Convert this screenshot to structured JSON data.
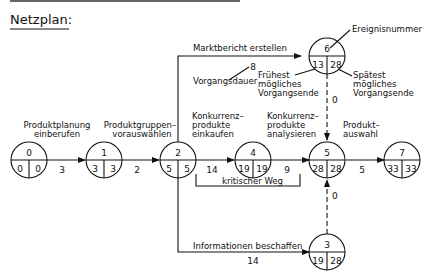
{
  "title": "Netzplan:",
  "nodes": [
    {
      "id": "0",
      "earliest": "0",
      "latest": "0"
    },
    {
      "id": "1",
      "earliest": "3",
      "latest": "3"
    },
    {
      "id": "2",
      "earliest": "5",
      "latest": "5"
    },
    {
      "id": "4",
      "earliest": "19",
      "latest": "19"
    },
    {
      "id": "5",
      "earliest": "28",
      "latest": "28"
    },
    {
      "id": "7",
      "earliest": "33",
      "latest": "33"
    },
    {
      "id": "6",
      "earliest": "13",
      "latest": "28"
    },
    {
      "id": "3",
      "earliest": "19",
      "latest": "28"
    }
  ],
  "activities": {
    "a01": {
      "label1": "Produktplanung",
      "label2": "einberufen",
      "duration": "3"
    },
    "a12": {
      "label1": "Produktgruppen–",
      "label2": "vorauswählen",
      "duration": "2"
    },
    "a24": {
      "label1": "Konkurrenz–",
      "label2": "produkte",
      "label3": "einkaufen",
      "duration": "14"
    },
    "a45": {
      "label1": "Konkurrenz–",
      "label2": "produkte",
      "label3": "analysieren",
      "duration": "9"
    },
    "a57": {
      "label1": "Produkt–",
      "label2": "auswahl",
      "duration": "5"
    },
    "a26": {
      "label": "Marktbericht erstellen",
      "duration": "8"
    },
    "a23": {
      "label": "Informationen beschaffen",
      "duration": "14"
    },
    "d65": {
      "duration": "0"
    },
    "d35": {
      "duration": "0"
    }
  },
  "annotations": {
    "event_number": "Ereignisnummer",
    "duration": "Vorgangsdauer",
    "earliest": [
      "Frühest",
      "mögliches",
      "Vorgangsende"
    ],
    "latest": [
      "Spätest",
      "mögliches",
      "Vorgangsende"
    ],
    "critical_path": "kritischer Weg"
  }
}
